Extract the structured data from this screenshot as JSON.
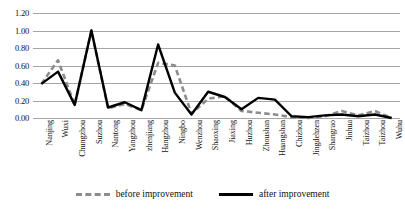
{
  "chart_data": {
    "type": "line",
    "title": "",
    "xlabel": "",
    "ylabel": "",
    "ylim": [
      0.0,
      1.2
    ],
    "ytick_labels": [
      "1.20",
      "1.00",
      "0.80",
      "0.60",
      "0.40",
      "0.20",
      "0.00"
    ],
    "ytick_values": [
      1.2,
      1.0,
      0.8,
      0.6,
      0.4,
      0.2,
      0.0
    ],
    "grid": true,
    "legend_position": "bottom-center",
    "categories": [
      "Nanjing",
      "Wuxi",
      "Chungzhou",
      "Suzhou",
      "Nantong",
      "Yangzhou",
      "zhenjiang",
      "Hangzhou",
      "Ningbo",
      "Wenzhou",
      "Shaoxing",
      "Jiaxing",
      "Huzhou",
      "Zhoushan",
      "Huangshan",
      "Chizhou",
      "Jingdehzen",
      "Shangrao",
      "Jinhua",
      "Taizhou",
      "Taizhou",
      "Wuhu"
    ],
    "series": [
      {
        "name": "before improvement",
        "style": "dashed",
        "color": "#8c8c8c",
        "values": [
          0.39,
          0.66,
          0.15,
          1.0,
          0.11,
          0.16,
          0.09,
          0.63,
          0.6,
          0.05,
          0.22,
          0.25,
          0.08,
          0.06,
          0.04,
          0.01,
          0.0,
          0.02,
          0.08,
          0.03,
          0.08,
          0.0
        ]
      },
      {
        "name": "after improvement",
        "style": "solid",
        "color": "#000000",
        "values": [
          0.39,
          0.53,
          0.15,
          1.0,
          0.12,
          0.18,
          0.09,
          0.84,
          0.29,
          0.04,
          0.3,
          0.24,
          0.1,
          0.23,
          0.21,
          0.02,
          0.01,
          0.03,
          0.04,
          0.02,
          0.04,
          0.0
        ]
      }
    ]
  },
  "legend": {
    "items": [
      {
        "label": "before improvement",
        "style": "dashed"
      },
      {
        "label": "after improvement",
        "style": "solid"
      }
    ]
  }
}
